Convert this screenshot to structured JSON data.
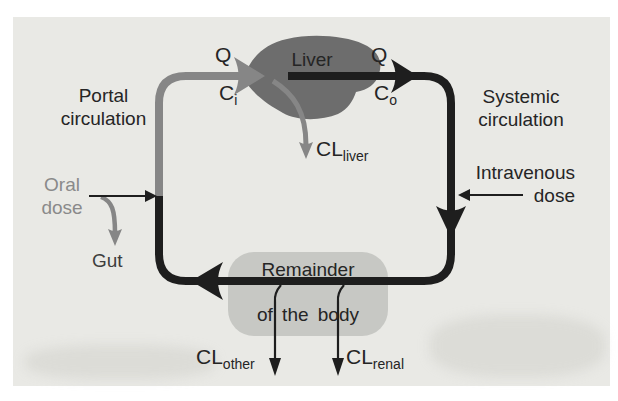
{
  "figure": {
    "labels": {
      "portal": {
        "line1": "Portal",
        "line2": "circulation"
      },
      "systemic": {
        "line1": "Systemic",
        "line2": "circulation"
      },
      "q_in": "Q",
      "q_out": "Q",
      "c_in": {
        "main": "C",
        "sub": "i"
      },
      "c_out": {
        "main": "C",
        "sub": "o"
      },
      "liver": "Liver",
      "cl_liver": {
        "main": "CL",
        "sub": "liver"
      },
      "oral_dose": {
        "line1": "Oral",
        "line2": "dose"
      },
      "gut": "Gut",
      "iv_dose": {
        "line1": "Intravenous",
        "line2": "dose"
      },
      "remainder": {
        "line1": "Remainder",
        "line2": "of the body"
      },
      "cl_other": {
        "main": "CL",
        "sub": "other"
      },
      "cl_renal": {
        "main": "CL",
        "sub": "renal"
      }
    },
    "colors": {
      "page": "#ffffff",
      "panel": "#e9e9e5",
      "flow_black": "#1e1e1e",
      "flow_gray": "#868686",
      "liver_fill": "#6d6d6d",
      "remainder_fill": "#c7c8c4",
      "text_dark": "#252525",
      "text_muted": "#8a8a8a"
    }
  }
}
